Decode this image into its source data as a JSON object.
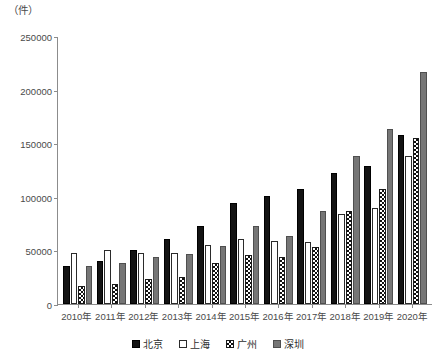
{
  "chart_data": {
    "type": "bar",
    "title": "",
    "subtitle": "",
    "xlabel": "",
    "ylabel": "（件）",
    "unit_label": "（件）",
    "categories": [
      "2010年",
      "2011年",
      "2012年",
      "2013年",
      "2014年",
      "2015年",
      "2016年",
      "2017年",
      "2018年",
      "2019年",
      "2020年"
    ],
    "series": [
      {
        "name": "北京",
        "color": "#131313",
        "pattern": "solid-black",
        "values": [
          35000,
          40000,
          50000,
          61000,
          73000,
          94000,
          101000,
          107000,
          122000,
          129000,
          158000
        ]
      },
      {
        "name": "上海",
        "color": "#ffffff",
        "pattern": "outline-white",
        "values": [
          48000,
          50000,
          48000,
          48000,
          55000,
          61000,
          59000,
          58000,
          84000,
          90000,
          138000
        ]
      },
      {
        "name": "广州",
        "color": "#ffffff",
        "pattern": "checkerboard",
        "values": [
          17000,
          19000,
          23000,
          25000,
          38000,
          46000,
          44000,
          53000,
          87000,
          107000,
          155000
        ]
      },
      {
        "name": "深圳",
        "color": "#767676",
        "pattern": "solid-gray",
        "values": [
          35000,
          38000,
          44000,
          47000,
          54000,
          73000,
          63000,
          87000,
          138000,
          163000,
          216000
        ]
      }
    ],
    "yticks": [
      0,
      50000,
      100000,
      150000,
      200000,
      250000
    ],
    "ytick_labels": [
      "0",
      "50000",
      "100000",
      "150000",
      "200000",
      "250000"
    ],
    "ylim": [
      0,
      250000
    ],
    "grid": false,
    "legend_position": "bottom",
    "legend_entries": [
      "北京",
      "上海",
      "广州",
      "深圳"
    ]
  }
}
